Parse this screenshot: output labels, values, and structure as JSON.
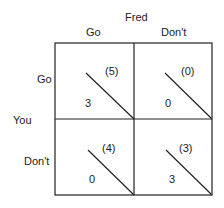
{
  "column_player": "Fred",
  "row_player": "You",
  "columns": [
    "Go",
    "Don't"
  ],
  "rows": [
    "Go",
    "Don't"
  ],
  "cells": [
    {
      "row": "Go",
      "col": "Go",
      "fred_payoff": "(5)",
      "you_payoff": "3"
    },
    {
      "row": "Go",
      "col": "Don't",
      "fred_payoff": "(0)",
      "you_payoff": "0"
    },
    {
      "row": "Don't",
      "col": "Go",
      "fred_payoff": "(4)",
      "you_payoff": "0"
    },
    {
      "row": "Don't",
      "col": "Don't",
      "fred_payoff": "(3)",
      "you_payoff": "3"
    }
  ]
}
